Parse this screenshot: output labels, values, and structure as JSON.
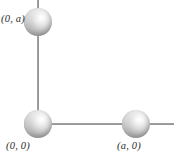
{
  "figure": {
    "name": "coordinate-axes-with-spheres",
    "background_color": "#ffffff",
    "axis_color": "#8c8c8c",
    "sphere_highlight_color": "#ffffff",
    "sphere_shadow_color": "#8a8a8a",
    "label_color": "#2b2b2b"
  },
  "axes": {
    "vertical": {
      "name": "y-axis"
    },
    "horizontal": {
      "name": "x-axis"
    }
  },
  "spheres": [
    {
      "id": "sphere-top",
      "label": "(0, a)"
    },
    {
      "id": "sphere-origin",
      "label": "(0, 0)"
    },
    {
      "id": "sphere-right",
      "label": "(a, 0)"
    }
  ],
  "labels": {
    "top": "(0, a)",
    "origin": "(0, 0)",
    "right": "(a, 0)"
  },
  "chart_data": {
    "type": "scatter",
    "title": "",
    "xlabel": "",
    "ylabel": "",
    "points": [
      {
        "x": 0,
        "y": "a",
        "label": "(0, a)"
      },
      {
        "x": 0,
        "y": 0,
        "label": "(0, 0)"
      },
      {
        "x": "a",
        "y": 0,
        "label": "(a, 0)"
      }
    ],
    "grid": false,
    "legend": "none"
  }
}
